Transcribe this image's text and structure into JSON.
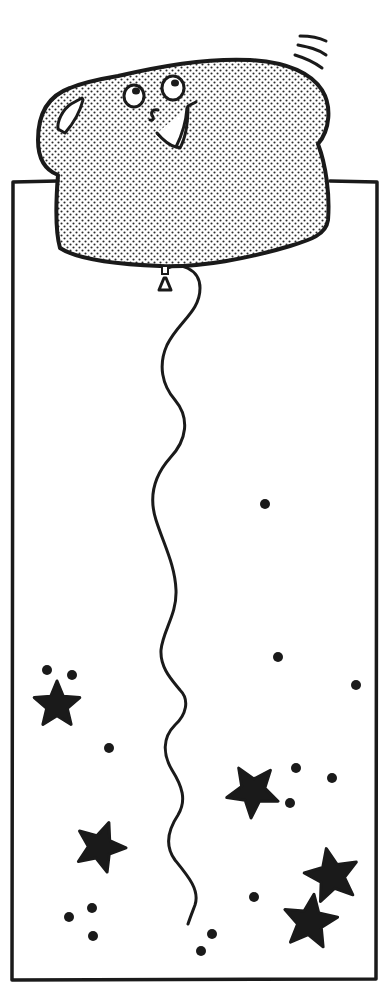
{
  "illustration": {
    "title": "Bread-slice balloon floating among stars",
    "description": "Line-art drawing of a smiling bread-slice-shaped balloon with a wavy string, rising out of a rectangular frame scattered with stars and dots",
    "colors": {
      "ink": "#1a1a1a",
      "paper": "#ffffff",
      "stipple": "#2a2a2a"
    },
    "frame": {
      "x": 12,
      "y": 180,
      "width": 365,
      "height": 800
    },
    "balloon": {
      "shape": "bread-slice",
      "face": [
        "left-eye",
        "right-eye",
        "nose",
        "smile"
      ],
      "highlight": "crust-shine",
      "motion_lines": 3
    },
    "stars": [
      {
        "cx": 57,
        "cy": 705,
        "r": 24
      },
      {
        "cx": 100,
        "cy": 847,
        "r": 26
      },
      {
        "cx": 253,
        "cy": 791,
        "r": 27
      },
      {
        "cx": 332,
        "cy": 876,
        "r": 28
      },
      {
        "cx": 310,
        "cy": 922,
        "r": 28
      }
    ],
    "dots": [
      {
        "cx": 47,
        "cy": 670
      },
      {
        "cx": 72,
        "cy": 675
      },
      {
        "cx": 109,
        "cy": 748
      },
      {
        "cx": 265,
        "cy": 504
      },
      {
        "cx": 278,
        "cy": 657
      },
      {
        "cx": 356,
        "cy": 685
      },
      {
        "cx": 296,
        "cy": 768
      },
      {
        "cx": 332,
        "cy": 778
      },
      {
        "cx": 290,
        "cy": 803
      },
      {
        "cx": 69,
        "cy": 917
      },
      {
        "cx": 92,
        "cy": 908
      },
      {
        "cx": 93,
        "cy": 936
      },
      {
        "cx": 254,
        "cy": 897
      },
      {
        "cx": 212,
        "cy": 934
      },
      {
        "cx": 201,
        "cy": 951
      }
    ]
  }
}
